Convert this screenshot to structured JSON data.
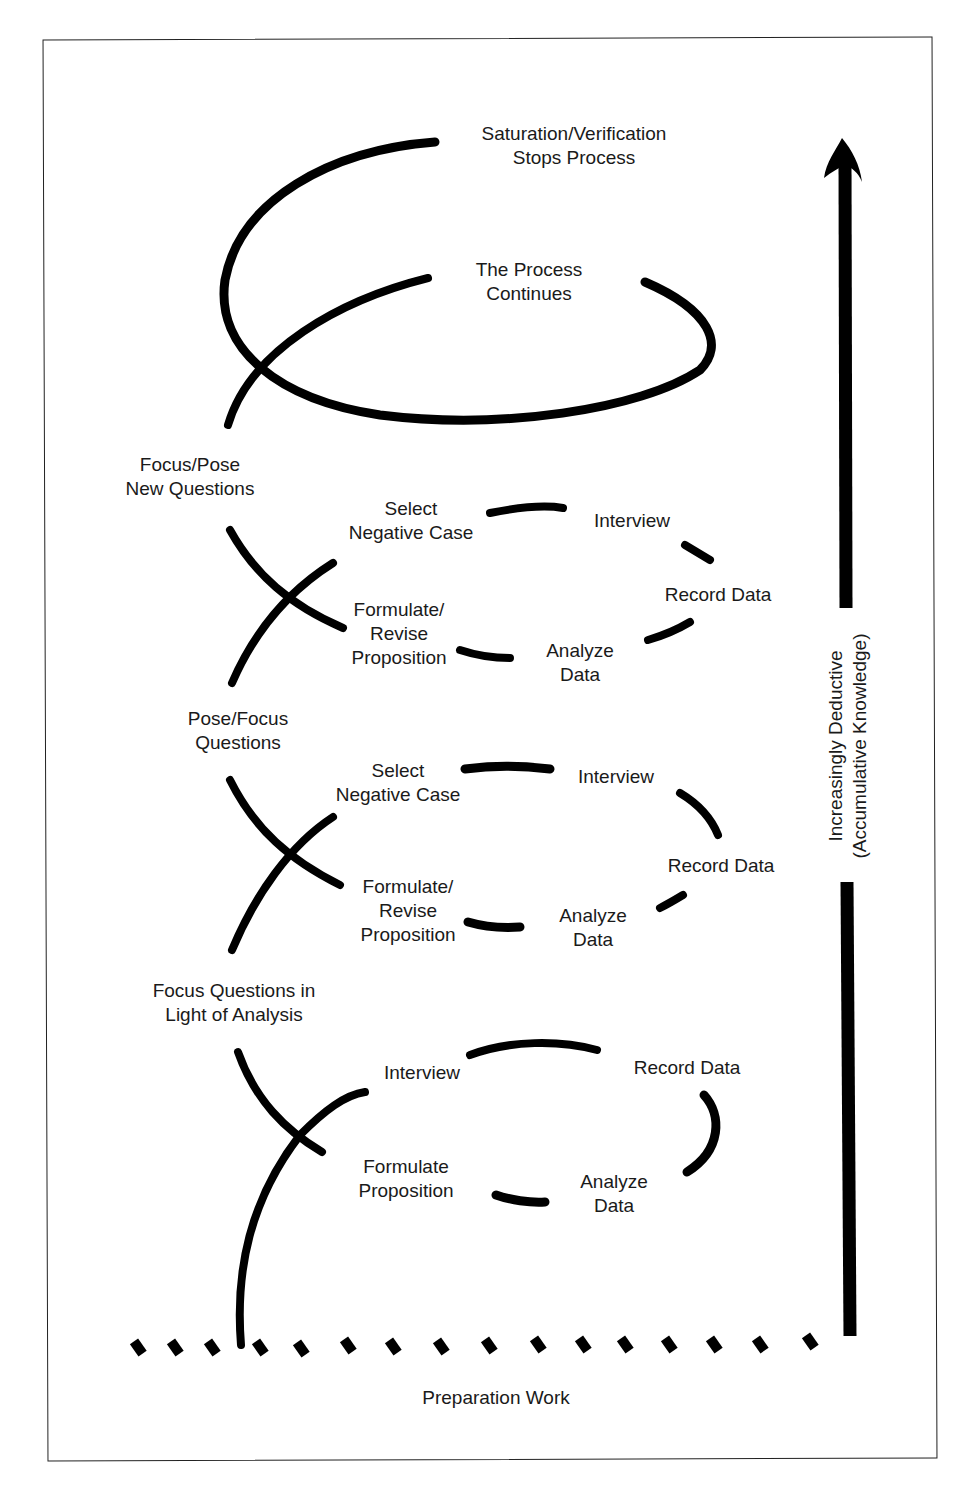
{
  "diagram": {
    "type": "spiral-process",
    "colors": {
      "stroke": "#000000",
      "text": "#1a1a1a",
      "background": "#ffffff",
      "frame": "#222222"
    },
    "top": {
      "stop_label": "Saturation/Verification\nStops Process",
      "continue_label": "The Process\nContinues"
    },
    "cycle3": {
      "entry_label": "Focus/Pose\nNew Questions",
      "steps": [
        "Select\nNegative Case",
        "Interview",
        "Record Data",
        "Analyze\nData",
        "Formulate/\nRevise\nProposition"
      ]
    },
    "cycle2": {
      "entry_label": "Pose/Focus\nQuestions",
      "steps": [
        "Select\nNegative Case",
        "Interview",
        "Record Data",
        "Analyze\nData",
        "Formulate/\nRevise\nProposition"
      ]
    },
    "cycle1": {
      "entry_label": "Focus Questions in\nLight of Analysis",
      "steps": [
        "Interview",
        "Record Data",
        "Analyze\nData",
        "Formulate\nProposition"
      ]
    },
    "base_label": "Preparation Work",
    "axis": {
      "label": "Increasingly Deductive\n(Accumulative Knowledge)",
      "direction": "up",
      "arrow_icon": "arrow-up-icon"
    }
  }
}
